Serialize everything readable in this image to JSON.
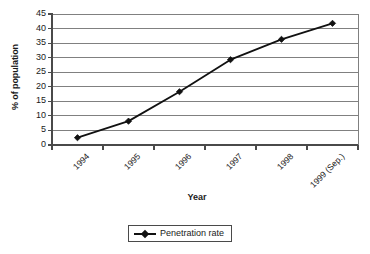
{
  "chart_data": {
    "type": "line",
    "title": "",
    "xlabel": "Year",
    "ylabel": "% of population",
    "categories": [
      "1994",
      "1995",
      "1996",
      "1997",
      "1998",
      "1999 (Sep.)"
    ],
    "series": [
      {
        "name": "Penetration rate",
        "values": [
          2.5,
          8.2,
          18.3,
          29.3,
          36.3,
          41.8
        ]
      }
    ],
    "ylim": [
      0,
      45
    ],
    "yticks": [
      0,
      5,
      10,
      15,
      20,
      25,
      30,
      35,
      40,
      45
    ],
    "ytick_labels": [
      "0",
      "5",
      "10",
      "15",
      "20",
      "25",
      "30",
      "35",
      "40",
      "45"
    ],
    "grid": "horizontal",
    "legend_position": "bottom-center",
    "marker": "diamond",
    "line_color": "#111111",
    "grid_color": "#808080",
    "axis_color": "#4a4a4a"
  },
  "legend": {
    "entries": [
      {
        "label": "Penetration rate",
        "marker": "diamond-marker"
      }
    ]
  },
  "axes": {
    "y_title": "% of population",
    "x_title": "Year"
  }
}
